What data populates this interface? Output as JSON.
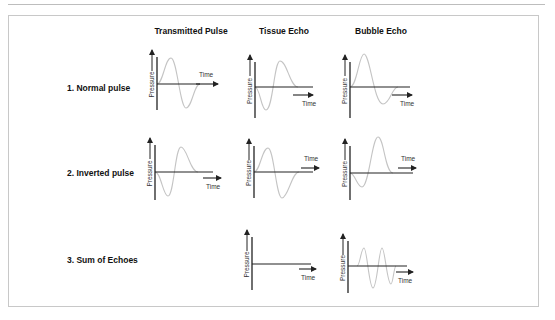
{
  "columns": [
    {
      "label": "Transmitted Pulse",
      "x": 191
    },
    {
      "label": "Tissue Echo",
      "x": 284
    },
    {
      "label": "Bubble Echo",
      "x": 381
    }
  ],
  "rows": [
    {
      "label": "1. Normal pulse",
      "x": 67,
      "y": 88
    },
    {
      "label": "2. Inverted pulse",
      "x": 67,
      "y": 173
    },
    {
      "label": "3. Sum of Echoes",
      "x": 67,
      "y": 260
    }
  ],
  "axis_labels": {
    "y": "Pressure",
    "x": "Time"
  },
  "colors": {
    "axis": "#222222",
    "wave": "#c4c4c4",
    "frame": "#c8c8c8"
  },
  "plots": [
    {
      "id": "normal-transmitted",
      "ax": 157,
      "ay": 84,
      "ytop": 57,
      "ybot": 110,
      "xend": 200,
      "arrowX": [
        196,
        218
      ],
      "arrowY": 84,
      "timeLabel": [
        199,
        77
      ],
      "wave": "M157,84 C163,84 165,58 171,58 C177,58 180,108 186,108 C192,108 194,84 200,84"
    },
    {
      "id": "normal-tissue",
      "ax": 255,
      "ay": 87,
      "ytop": 62,
      "ybot": 118,
      "xend": 313,
      "arrowX": [
        293,
        313
      ],
      "arrowY": 95,
      "timeLabel": [
        302,
        106
      ],
      "wave": "M255,87 C260,87 261,110 266,110 C273,110 274,61 280,61 C287,61 290,87 298,87"
    },
    {
      "id": "normal-bubble",
      "ax": 350,
      "ay": 87,
      "ytop": 62,
      "ybot": 118,
      "xend": 410,
      "arrowX": [
        392,
        412
      ],
      "arrowY": 95,
      "timeLabel": [
        400,
        106
      ],
      "wave": "M350,87 C357,87 359,54 364,54 C370,54 374,104 383,104 C390,104 392,87 398,87"
    },
    {
      "id": "inverted-transmitted",
      "ax": 155,
      "ay": 172,
      "ytop": 145,
      "ybot": 200,
      "xend": 213,
      "arrowX": [
        203,
        221
      ],
      "arrowY": 178,
      "timeLabel": [
        206,
        189
      ],
      "wave": "M155,172 C161,172 163,196 168,196 C174,196 175,147 181,147 C187,147 190,172 198,172"
    },
    {
      "id": "inverted-tissue",
      "ax": 254,
      "ay": 172,
      "ytop": 146,
      "ybot": 198,
      "xend": 313,
      "arrowX": [
        301,
        319
      ],
      "arrowY": 168,
      "timeLabel": [
        304,
        161
      ],
      "wave": "M254,172 C260,172 262,148 268,148 C274,148 276,198 282,198 C288,198 292,172 299,172"
    },
    {
      "id": "inverted-bubble",
      "ax": 350,
      "ay": 173,
      "ytop": 146,
      "ybot": 200,
      "xend": 413,
      "arrowX": [
        398,
        416
      ],
      "arrowY": 168,
      "timeLabel": [
        401,
        161
      ],
      "wave": "M350,173 C355,173 357,187 362,187 C369,187 372,137 378,137 C384,137 385,173 393,173"
    },
    {
      "id": "sum-tissue",
      "ax": 252,
      "ay": 264,
      "ytop": 237,
      "ybot": 290,
      "xend": 311,
      "arrowX": [
        299,
        316
      ],
      "arrowY": 269,
      "timeLabel": [
        301,
        280
      ],
      "wave": ""
    },
    {
      "id": "sum-bubble",
      "ax": 348,
      "ay": 266,
      "ytop": 241,
      "ybot": 293,
      "xend": 407,
      "arrowX": [
        396,
        413
      ],
      "arrowY": 272,
      "timeLabel": [
        398,
        283
      ],
      "wave": "M357,266 C360,266 361,248 364,248 C367,248 369,288 373,288 C377,288 379,248 382,248 C385,248 387,284 391,284 C393,284 394,266 396,266"
    }
  ]
}
